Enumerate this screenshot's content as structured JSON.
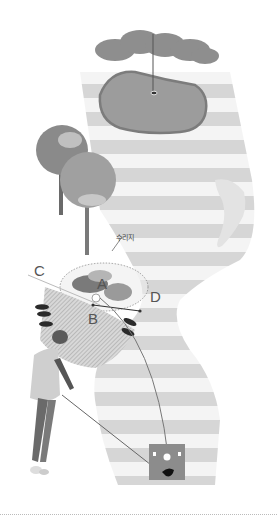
{
  "labels": {
    "hazard": "수리지",
    "a": "A",
    "b": "B",
    "c": "C",
    "d": "D"
  },
  "colors": {
    "stripe_dark": "#d4d4d4",
    "stripe_light": "#f2f2f2",
    "green": "#9a9a9a",
    "green_edge": "#7a7a7a",
    "tree": "#8a8a8a",
    "bunker": "#e6e6e6",
    "tee_box": "#8c8c8c",
    "line": "#666666"
  },
  "icons": [
    "flag-icon",
    "tree-icon",
    "bunker-icon",
    "golfer-figure",
    "tee-box-icon",
    "ball-marker-icon"
  ]
}
